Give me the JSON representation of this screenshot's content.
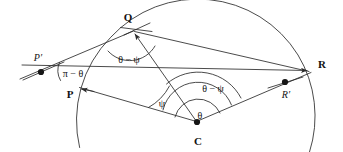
{
  "figure": {
    "type": "geometry-diagram",
    "width": 343,
    "height": 152,
    "stroke_color": "#2b2b2b",
    "background_color": "#ffffff",
    "text_color": "#121212"
  },
  "points": [
    {
      "id": "P-prime",
      "label": "P′",
      "style": "italic-prime",
      "x": 41,
      "y": 72,
      "label_x": 38,
      "label_y": 58,
      "dot": true
    },
    {
      "id": "P",
      "label": "P",
      "style": "bold",
      "x": 80,
      "y": 89,
      "label_x": 70,
      "label_y": 94,
      "dot": false
    },
    {
      "id": "Q",
      "label": "Q",
      "style": "bold",
      "x": 133,
      "y": 30,
      "label_x": 128,
      "label_y": 17,
      "dot": false
    },
    {
      "id": "C",
      "label": "C",
      "style": "bold",
      "x": 197,
      "y": 122,
      "label_x": 198,
      "label_y": 141,
      "dot": true
    },
    {
      "id": "R-prime",
      "label": "R′",
      "style": "italic-prime",
      "x": 285,
      "y": 82,
      "label_x": 286,
      "label_y": 95,
      "dot": true
    },
    {
      "id": "R",
      "label": "R",
      "style": "bold",
      "x": 312,
      "y": 72,
      "label_x": 322,
      "label_y": 64,
      "dot": false
    }
  ],
  "angles": [
    {
      "id": "angle-pi-minus-theta",
      "label": "π − θ",
      "vertex": "P-prime",
      "label_x": 73,
      "label_y": 74
    },
    {
      "id": "angle-theta-minus-psi-at-Q",
      "label": "θ − ψ",
      "vertex": "Q",
      "label_x": 129,
      "label_y": 60
    },
    {
      "id": "angle-psi-at-C",
      "label": "ψ",
      "vertex": "C",
      "label_x": 162,
      "label_y": 104
    },
    {
      "id": "angle-theta-minus-psi-at-C",
      "label": "θ − ψ",
      "vertex": "C",
      "label_x": 213,
      "label_y": 89
    },
    {
      "id": "angle-theta-at-C",
      "label": "θ",
      "vertex": "C",
      "label_x": 200,
      "label_y": 116
    }
  ],
  "segments": [
    {
      "id": "chord-line",
      "from": "P-prime",
      "to": "R",
      "note": "straight line through P and R-prime"
    },
    {
      "id": "radius-CP",
      "from": "C",
      "to": "P"
    },
    {
      "id": "radius-CQ",
      "from": "C",
      "to": "Q"
    },
    {
      "id": "radius-CR",
      "from": "C",
      "to": "R"
    },
    {
      "id": "chord-QR",
      "from": "Q",
      "to": "R"
    },
    {
      "id": "ray-QP-prime",
      "from": "Q",
      "to": "P-prime"
    },
    {
      "id": "tangent-at-Q",
      "note": "short tangent tick crossing Q"
    },
    {
      "id": "tick-at-P-prime",
      "note": "short tick crossing P-prime"
    },
    {
      "id": "tick-at-R-prime",
      "note": "short tick crossing R-prime"
    }
  ],
  "arc": {
    "id": "main-circle-arc",
    "center_x": 197,
    "center_y": 122,
    "radius": 118,
    "note": "arc of the circle centered at C passing through P, Q and R"
  },
  "arrows": [
    {
      "id": "arrow-into-Q",
      "target": "Q",
      "direction": "up-right along ray toward Q"
    },
    {
      "id": "arrow-at-P",
      "target": "P",
      "direction": "left along chord line toward P"
    },
    {
      "id": "arrow-into-R",
      "target": "R",
      "direction": "up-right along chord line toward R"
    }
  ]
}
